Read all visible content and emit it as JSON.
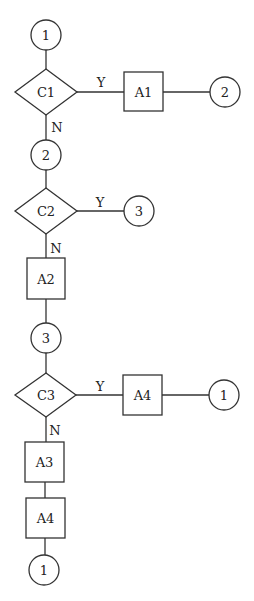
{
  "diagram": {
    "type": "flowchart",
    "nodes": {
      "conn_1_top": "1",
      "c1": "C1",
      "a1": "A1",
      "conn_2_right": "2",
      "conn_2": "2",
      "c2": "C2",
      "conn_3_right": "3",
      "a2": "A2",
      "conn_3": "3",
      "c3": "C3",
      "a4_right": "A4",
      "conn_1_right": "1",
      "a3": "A3",
      "a4": "A4",
      "conn_1_bottom": "1"
    },
    "edge_labels": {
      "c1_yes": "Y",
      "c1_no": "N",
      "c2_yes": "Y",
      "c2_no": "N",
      "c3_yes": "Y",
      "c3_no": "N"
    }
  }
}
